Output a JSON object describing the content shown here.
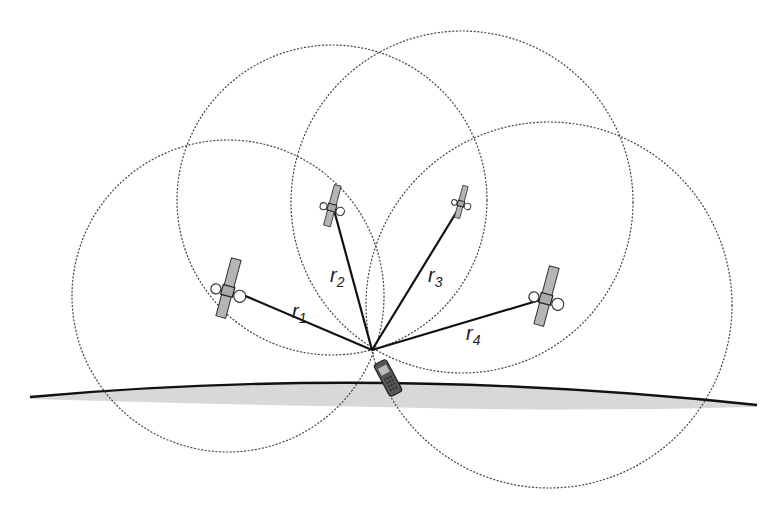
{
  "diagram": {
    "type": "GPS trilateration illustration",
    "receiver": {
      "name": "handheld receiver",
      "x": 372,
      "y": 350
    },
    "satellites": [
      {
        "id": "sat1",
        "x": 228,
        "y": 290,
        "scale": 1.0,
        "range_label": "r",
        "range_sub": "1",
        "circle_r": 156
      },
      {
        "id": "sat2",
        "x": 332,
        "y": 207,
        "scale": 0.7,
        "range_label": "r",
        "range_sub": "2",
        "circle_r": 155
      },
      {
        "id": "sat3",
        "x": 461,
        "y": 203,
        "scale": 0.55,
        "range_label": "r",
        "range_sub": "3",
        "circle_r": 170
      },
      {
        "id": "sat4",
        "x": 546,
        "y": 298,
        "scale": 1.0,
        "range_label": "r",
        "range_sub": "4",
        "circle_r": 183
      }
    ],
    "labels": {
      "r1": {
        "main": "r",
        "sub": "1"
      },
      "r2": {
        "main": "r",
        "sub": "2"
      },
      "r3": {
        "main": "r",
        "sub": "3"
      },
      "r4": {
        "main": "r",
        "sub": "4"
      }
    },
    "colors": {
      "line": "#111111",
      "circle": "#444444",
      "earth_fill": "#d6d6d6",
      "panel_fill": "#b5b5b5"
    }
  }
}
